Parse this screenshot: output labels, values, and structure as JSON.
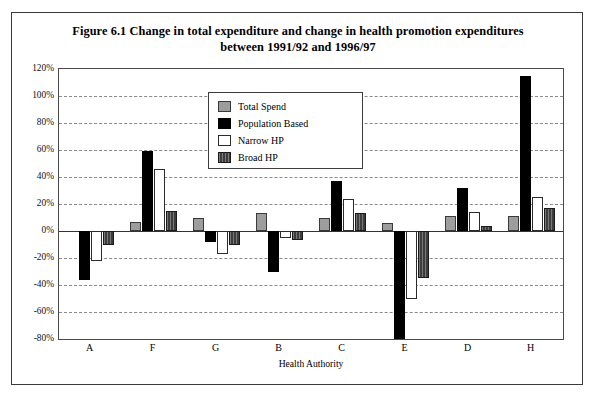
{
  "chart_data": {
    "type": "bar",
    "title": "Figure 6.1 Change in total expenditure and change in health promotion expenditures between 1991/92 and 1996/97",
    "title_line1": "Figure 6.1 Change in total expenditure and change in health promotion expenditures",
    "title_line2": "between 1991/92 and 1996/97",
    "xlabel": "Health Authority",
    "ylabel": "",
    "categories": [
      "A",
      "F",
      "G",
      "B",
      "C",
      "E",
      "D",
      "H"
    ],
    "series": [
      {
        "name": "Total Spend",
        "color": "#9d9d9d",
        "values": [
          0,
          7,
          10,
          13,
          10,
          6,
          11,
          11
        ]
      },
      {
        "name": "Population Based",
        "color": "#000000",
        "values": [
          -36,
          59,
          -8,
          -30,
          37,
          -80,
          32,
          115
        ]
      },
      {
        "name": "Narrow HP",
        "color": "#ffffff",
        "values": [
          -22,
          46,
          -17,
          -5,
          24,
          -50,
          14,
          25
        ]
      },
      {
        "name": "Broad HP",
        "color": "#3d3d3d",
        "values": [
          -10,
          15,
          -10,
          -7,
          13,
          -35,
          4,
          17
        ]
      }
    ],
    "ylim": [
      -80,
      120
    ],
    "ytick_step": 20,
    "ytick_labels": [
      "120%",
      "100%",
      "80%",
      "60%",
      "40%",
      "20%",
      "0%",
      "-20%",
      "-40%",
      "-60%",
      "-80%"
    ],
    "ytick_values": [
      120,
      100,
      80,
      60,
      40,
      20,
      0,
      -20,
      -40,
      -60,
      -80
    ],
    "grid": true,
    "legend_position": "inside-upper-center"
  }
}
